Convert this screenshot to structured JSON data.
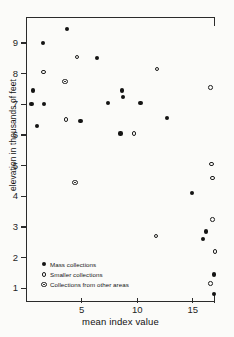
{
  "chart_data": {
    "type": "scatter",
    "title": "",
    "xlabel": "mean index value",
    "ylabel": "elevation in thousands of feet",
    "xlim": [
      0,
      17.0
    ],
    "ylim": [
      0.55,
      9.85
    ],
    "xticks": [
      5,
      10,
      15
    ],
    "yticks": [
      1,
      2,
      3,
      4,
      5,
      6,
      7,
      8,
      9
    ],
    "grid": false,
    "legend_position": "lower-left-inside",
    "series": [
      {
        "name": "Mass collections",
        "marker": "filled-circle",
        "color": "#141414",
        "points": [
          [
            1.5,
            9.0
          ],
          [
            3.7,
            9.45
          ],
          [
            6.4,
            8.5
          ],
          [
            0.6,
            7.45
          ],
          [
            1.6,
            7.0
          ],
          [
            0.5,
            7.0
          ],
          [
            7.4,
            7.05
          ],
          [
            8.6,
            7.45
          ],
          [
            8.7,
            7.25
          ],
          [
            10.3,
            7.05
          ],
          [
            16.2,
            2.85
          ],
          [
            1.0,
            6.3
          ],
          [
            4.9,
            6.45
          ],
          [
            8.5,
            6.05
          ],
          [
            12.7,
            6.55
          ],
          [
            14.9,
            4.1
          ],
          [
            15.9,
            2.6
          ],
          [
            16.9,
            1.45
          ],
          [
            16.9,
            0.8
          ]
        ]
      },
      {
        "name": "Smaller collections",
        "marker": "open-circle",
        "color": "#1d1d1d",
        "points": [
          [
            1.6,
            8.05
          ],
          [
            4.6,
            8.55
          ],
          [
            11.8,
            8.15
          ],
          [
            3.6,
            6.5
          ],
          [
            9.7,
            6.05
          ],
          [
            16.6,
            7.55
          ],
          [
            16.7,
            5.05
          ],
          [
            16.8,
            4.6
          ],
          [
            16.8,
            3.25
          ],
          [
            16.6,
            1.15
          ],
          [
            11.7,
            2.7
          ],
          [
            17.0,
            2.2
          ]
        ]
      },
      {
        "name": "Collections from other areas",
        "marker": "bullseye",
        "color": "#1d1d1d",
        "points": [
          [
            3.5,
            7.75
          ],
          [
            4.4,
            4.45
          ]
        ]
      }
    ]
  },
  "legend": {
    "items": [
      {
        "label": "Mass collections",
        "marker": "filled"
      },
      {
        "label": "Smaller collections",
        "marker": "open"
      },
      {
        "label": "Collections from other areas",
        "marker": "bullseye"
      }
    ]
  },
  "axes": {
    "x_tick_labels": [
      "5",
      "10",
      "15"
    ],
    "y_tick_labels": [
      "9",
      "8",
      "7",
      "6",
      "5",
      "4",
      "3",
      "2",
      "1"
    ]
  }
}
